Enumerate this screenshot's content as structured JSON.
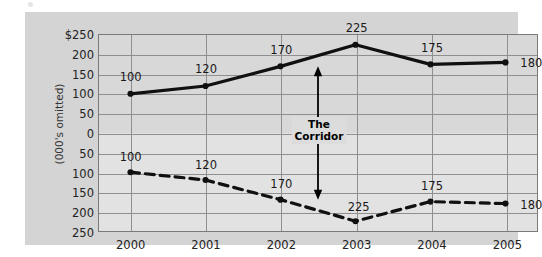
{
  "chart_data": {
    "type": "line",
    "title": "",
    "subtitle": "",
    "xlabel": "",
    "ylabel": "(000's omitted)",
    "categories": [
      "2000",
      "2001",
      "2002",
      "2003",
      "2004",
      "2005"
    ],
    "series": [
      {
        "name": "upper",
        "style": "solid",
        "values": [
          100,
          120,
          170,
          225,
          175,
          180
        ],
        "labels": [
          "100",
          "120",
          "170",
          "225",
          "175",
          "180"
        ]
      },
      {
        "name": "lower",
        "style": "dashed",
        "values": [
          100,
          120,
          170,
          225,
          175,
          180
        ],
        "labels": [
          "100",
          "120",
          "170",
          "225",
          "175",
          "180"
        ]
      }
    ],
    "y_ticks": [
      "$250",
      "200",
      "150",
      "100",
      "50",
      "0",
      "50",
      "100",
      "150",
      "200",
      "250"
    ],
    "y_tick_values": [
      250,
      200,
      150,
      100,
      50,
      0,
      -50,
      -100,
      -150,
      -200,
      -250
    ],
    "ylim": [
      -250,
      250
    ],
    "grid": true,
    "legend": "none",
    "annotations": [
      {
        "name": "corridor",
        "text_line1": "The",
        "text_line2": "Corridor",
        "arrow": "double-headed-vertical",
        "x_between": [
          "2002",
          "2003"
        ],
        "from_value": 170,
        "to_value": -170
      }
    ],
    "colors": {
      "panel": "#d4d4d4",
      "plot_bg": "#dcdcdc",
      "grid": "#8f8f8f",
      "frame": "#7a7a7a",
      "line": "#101010",
      "text": "#1a1a1a"
    }
  }
}
